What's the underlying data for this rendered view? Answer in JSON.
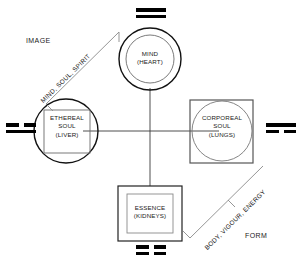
{
  "diagram": {
    "background_color": "#ffffff",
    "stroke_color": "#1a1a1a",
    "nodes": [
      {
        "id": "mind",
        "name": "MIND",
        "organ": "(HEART)",
        "shape": "circle-in-circle",
        "position": "top"
      },
      {
        "id": "ethereal-soul",
        "name": "ETHEREAL",
        "name2": "SOUL",
        "organ": "(LIVER)",
        "shape": "square-in-circle",
        "position": "left"
      },
      {
        "id": "corporeal-soul",
        "name": "CORPOREAL",
        "name2": "SOUL",
        "organ": "(LUNGS)",
        "shape": "circle-in-square",
        "position": "right"
      },
      {
        "id": "essence",
        "name": "ESSENCE",
        "organ": "(KIDNEYS)",
        "shape": "square-in-square",
        "position": "bottom"
      }
    ],
    "corner_labels": {
      "image": "IMAGE",
      "form": "FORM"
    },
    "diagonal_labels": {
      "upper_left": "MIND, SOUL, SPIRIT",
      "lower_right": "BODY, VIGOUR, ENERGY"
    },
    "bigrams": [
      {
        "id": "top",
        "position": "top",
        "lines": [
          "solid",
          "solid"
        ]
      },
      {
        "id": "left",
        "position": "left",
        "lines": [
          "broken",
          "solid"
        ]
      },
      {
        "id": "right",
        "position": "right",
        "lines": [
          "solid",
          "broken"
        ]
      },
      {
        "id": "bottom",
        "position": "bottom",
        "lines": [
          "broken",
          "broken"
        ]
      }
    ]
  }
}
